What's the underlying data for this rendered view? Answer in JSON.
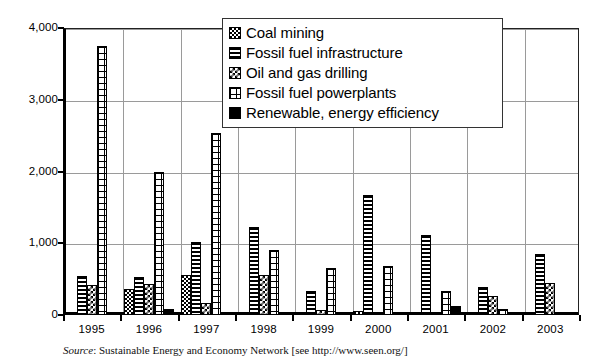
{
  "chart_data": {
    "type": "bar",
    "title": "",
    "xlabel": "",
    "ylabel": "",
    "ylim": [
      0,
      4000
    ],
    "ytick_values": [
      4000,
      3000,
      2000,
      1000,
      0
    ],
    "ytick_labels": [
      "4,000",
      "3,000",
      "2,000",
      "1,000",
      "0"
    ],
    "grid": true,
    "legend_position": "top-right",
    "categories": [
      "1995",
      "1996",
      "1997",
      "1998",
      "1999",
      "2000",
      "2001",
      "2002",
      "2003"
    ],
    "series": [
      {
        "name": "Coal mining",
        "pattern": "coal",
        "values": [
          0,
          360,
          560,
          0,
          0,
          60,
          0,
          0,
          0
        ]
      },
      {
        "name": "Fossil fuel infrastructure",
        "pattern": "infra",
        "values": [
          540,
          530,
          1020,
          1230,
          330,
          1670,
          1120,
          390,
          850
        ]
      },
      {
        "name": "Oil and gas drilling",
        "pattern": "oilgas",
        "values": [
          420,
          430,
          170,
          560,
          70,
          0,
          0,
          270,
          440
        ]
      },
      {
        "name": "Fossil fuel powerplants",
        "pattern": "power",
        "values": [
          3750,
          2000,
          2540,
          900,
          660,
          680,
          330,
          80,
          0
        ]
      },
      {
        "name": "Renewable, energy efficiency",
        "pattern": "renew",
        "values": [
          0,
          90,
          20,
          20,
          20,
          20,
          130,
          20,
          20
        ]
      }
    ]
  },
  "legend": {
    "items": [
      {
        "label": "Coal mining",
        "pattern": "coal"
      },
      {
        "label": "Fossil fuel infrastructure",
        "pattern": "infra"
      },
      {
        "label": "Oil and gas drilling",
        "pattern": "oilgas"
      },
      {
        "label": "Fossil fuel powerplants",
        "pattern": "power"
      },
      {
        "label": "Renewable, energy efficiency",
        "pattern": "renew"
      }
    ]
  },
  "caption": {
    "source_word": "Source",
    "text": ": Sustainable Energy and Economy Network [see http://www.seen.org/]"
  }
}
